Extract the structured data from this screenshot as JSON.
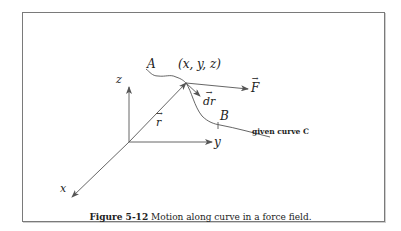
{
  "figure": {
    "labels": {
      "z_axis": "z",
      "y_axis": "y",
      "x_axis": "x",
      "point_A": "A",
      "point_B": "B",
      "point_xyz": "(x, y, z)",
      "force": "F",
      "position_vector": "r",
      "displacement": "dr",
      "curve_name": "given curve C"
    },
    "caption": {
      "number": "Figure 5-12",
      "text": "Motion along curve in a force field."
    },
    "colors": {
      "line": "#555555",
      "frame": "#7a7a7a",
      "text": "#222222"
    }
  }
}
